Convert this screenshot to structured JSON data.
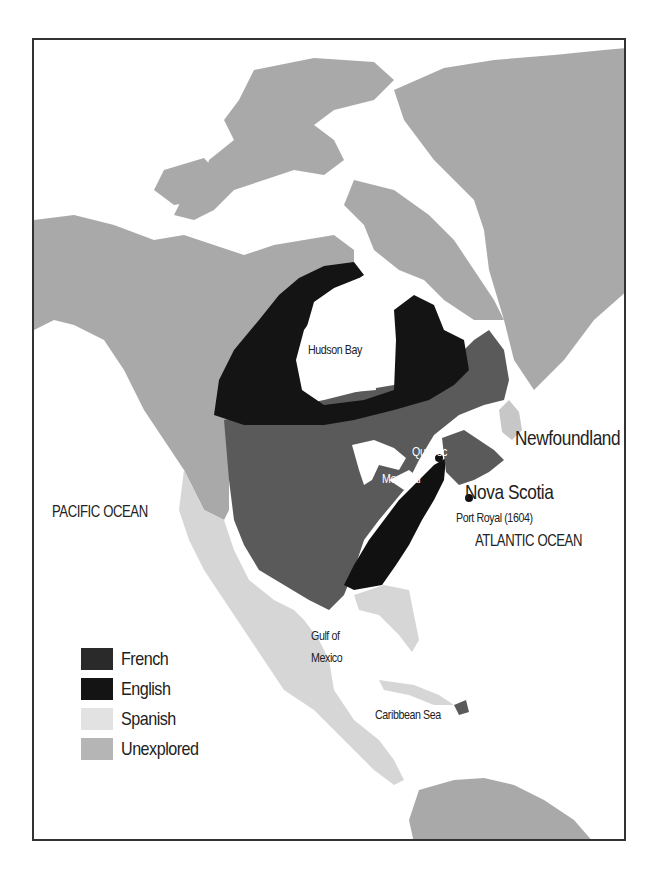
{
  "map": {
    "colors": {
      "french": "#5a5a5a",
      "english": "#111111",
      "spanish": "#d6d6d6",
      "unexplored": "#a9a9a9",
      "water": "#ffffff",
      "frame": "#333333"
    },
    "labels": {
      "hudson_bay": "Hudson Bay",
      "newfoundland": "Newfoundland",
      "quebec": "Quebec",
      "montreal": "Montreal",
      "nova_scotia": "Nova Scotia",
      "port_royal": "Port Royal (1604)",
      "pacific_ocean": "PACIFIC OCEAN",
      "atlantic_ocean": "ATLANTIC OCEAN",
      "gulf_of_mexico_line1": "Gulf of",
      "gulf_of_mexico_line2": "Mexico",
      "caribbean_sea": "Caribbean Sea"
    },
    "legend": [
      {
        "label": "French",
        "color": "#2a2a2a"
      },
      {
        "label": "English",
        "color": "#141414"
      },
      {
        "label": "Spanish",
        "color": "#e2e2e2"
      },
      {
        "label": "Unexplored",
        "color": "#b5b5b5"
      }
    ]
  }
}
